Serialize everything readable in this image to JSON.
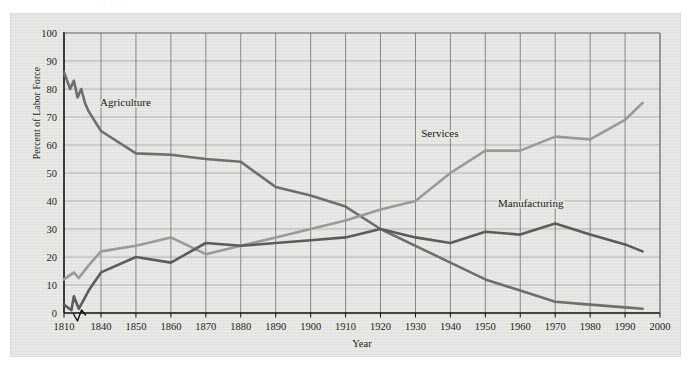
{
  "figure": {
    "background_color": "#e4e4e1",
    "page_color": "#ffffff",
    "top_artifact_text": "·· ··"
  },
  "chart_data": {
    "type": "line",
    "title": "",
    "subtitle": "",
    "xlabel": "Year",
    "ylabel": "Percent of Labor Force",
    "xlim": [
      1810,
      2000
    ],
    "ylim": [
      0,
      100
    ],
    "grid": true,
    "legend_position": "inline-annotations",
    "axis_break": {
      "present": true,
      "between": [
        1810,
        1840
      ],
      "note": "zigzag break symbol on x-axis between 1810 and 1840"
    },
    "y_ticks": [
      0,
      10,
      20,
      30,
      40,
      50,
      60,
      70,
      80,
      90,
      100
    ],
    "x_ticks": [
      1810,
      1840,
      1850,
      1860,
      1870,
      1880,
      1890,
      1900,
      1910,
      1920,
      1930,
      1940,
      1950,
      1960,
      1970,
      1980,
      1990,
      2000
    ],
    "x_tick_labels": [
      "1810",
      "1840",
      "1850",
      "1860",
      "1870",
      "1880",
      "1890",
      "1900",
      "1910",
      "1920",
      "1930",
      "1940",
      "1950",
      "1960",
      "1970",
      "1980",
      "1990",
      "2000"
    ],
    "series": [
      {
        "name": "Agriculture",
        "color": "#6e6e6e",
        "label_x": 1847,
        "label_y": 74,
        "x": [
          1810,
          1815,
          1818,
          1821,
          1824,
          1827,
          1830,
          1840,
          1850,
          1860,
          1870,
          1880,
          1890,
          1900,
          1910,
          1920,
          1930,
          1940,
          1950,
          1960,
          1970,
          1980,
          1990,
          1995
        ],
        "values": [
          86,
          80,
          83,
          77,
          80,
          75,
          72,
          65,
          57,
          56.5,
          55,
          54,
          45,
          42,
          38,
          30,
          24,
          18,
          12,
          8,
          4,
          3,
          2,
          1.5
        ]
      },
      {
        "name": "Services",
        "color": "#9a9a9a",
        "label_x": 1937,
        "label_y": 63,
        "x": [
          1810,
          1818,
          1822,
          1830,
          1840,
          1850,
          1860,
          1870,
          1880,
          1890,
          1900,
          1910,
          1920,
          1930,
          1940,
          1950,
          1960,
          1970,
          1980,
          1990,
          1995
        ],
        "values": [
          12,
          14.5,
          12.5,
          17,
          22,
          24,
          27,
          21,
          24,
          27,
          30,
          33,
          37,
          40,
          50,
          58,
          58,
          63,
          62,
          69,
          75
        ]
      },
      {
        "name": "Manufacturing",
        "color": "#5c5c5c",
        "label_x": 1963,
        "label_y": 38,
        "x": [
          1810,
          1816,
          1818,
          1822,
          1830,
          1840,
          1850,
          1860,
          1870,
          1880,
          1890,
          1900,
          1910,
          1920,
          1930,
          1940,
          1950,
          1960,
          1970,
          1980,
          1990,
          1995
        ],
        "values": [
          3,
          1,
          6,
          1.5,
          8,
          14.5,
          20,
          18,
          25,
          24,
          25,
          26,
          27,
          30,
          27,
          25,
          29,
          28,
          32,
          28,
          24.5,
          22
        ]
      }
    ]
  }
}
